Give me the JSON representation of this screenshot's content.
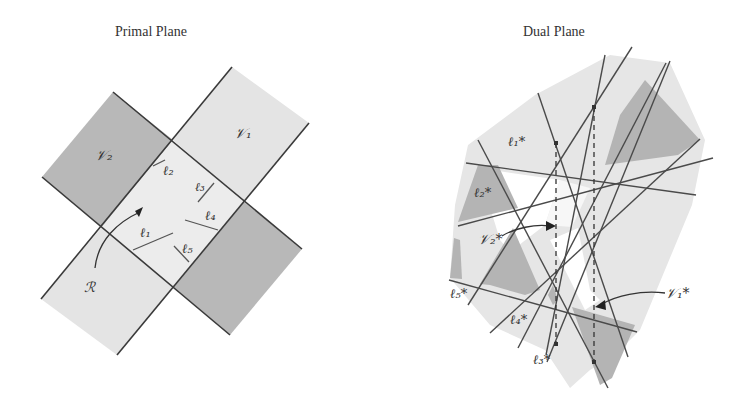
{
  "primal": {
    "title": "Primal Plane",
    "labels": {
      "v1": "𝒱₁",
      "v2": "𝒱₂",
      "l1": "ℓ₁",
      "l2": "ℓ₂",
      "l3": "ℓ₃",
      "l4": "ℓ₄",
      "l5": "ℓ₅",
      "r": "ℛ"
    }
  },
  "dual": {
    "title": "Dual  Plane",
    "labels": {
      "l1": "ℓ₁*",
      "l2": "ℓ₂*",
      "l3": "ℓ₃*",
      "l4": "ℓ₄*",
      "l5": "ℓ₅*",
      "v1": "𝒱₁*",
      "v2": "𝒱₂*"
    }
  },
  "colors": {
    "light": "#e6e6e6",
    "dark": "#b4b4b4",
    "center": "#eeeeee",
    "line": "#444444"
  }
}
